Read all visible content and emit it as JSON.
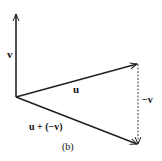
{
  "figure": {
    "caption": "(b)",
    "vectors": [
      {
        "id": "v",
        "label": "v",
        "from": [
          16,
          97
        ],
        "to": [
          16,
          13
        ],
        "style": "solid"
      },
      {
        "id": "u",
        "label": "u",
        "from": [
          16,
          97
        ],
        "to": [
          138,
          64
        ],
        "style": "solid"
      },
      {
        "id": "neg-v",
        "label": "−v",
        "from": [
          138,
          64
        ],
        "to": [
          138,
          145
        ],
        "style": "dashed"
      },
      {
        "id": "u-plus-neg-v",
        "label": "u + (−v)",
        "from": [
          16,
          97
        ],
        "to": [
          138,
          145
        ],
        "style": "solid"
      }
    ],
    "labels": {
      "v": "v",
      "u": "u",
      "neg_v": "−v",
      "sum": "u + (−v)",
      "caption": "(b)"
    },
    "colors": {
      "stroke": "#222222",
      "text": "#111111",
      "background": "#ffffff"
    }
  }
}
